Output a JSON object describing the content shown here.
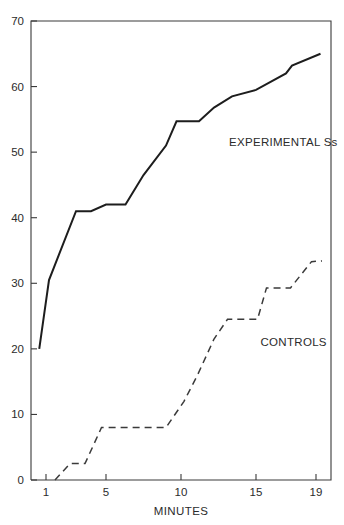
{
  "chart_data": {
    "type": "line",
    "title": "",
    "xlabel": "MINUTES",
    "ylabel": "",
    "xlim": [
      0,
      20
    ],
    "ylim": [
      0,
      70
    ],
    "grid": false,
    "legend_position": "inline-annotation",
    "x_ticks": [
      1,
      5,
      10,
      15,
      19
    ],
    "x_tick_labels": [
      "1",
      "5",
      "10",
      "15",
      "19"
    ],
    "y_ticks": [
      0,
      10,
      20,
      30,
      40,
      50,
      60,
      70
    ],
    "y_tick_labels": [
      "0",
      "10",
      "20",
      "30",
      "40",
      "50",
      "60",
      "70"
    ],
    "series": [
      {
        "name": "EXPERIMENTAL Ss",
        "style": "solid",
        "color": "#1d1d1d",
        "annotation": "EXPERIMENTAL Ss",
        "x": [
          0.55,
          1.2,
          3.0,
          4.0,
          5.0,
          6.3,
          7.5,
          9.0,
          9.7,
          11.2,
          12.2,
          13.4,
          15.0,
          17.0,
          17.4,
          19.3
        ],
        "y": [
          20.0,
          30.5,
          41.0,
          41.0,
          42.0,
          42.0,
          46.5,
          51.0,
          54.7,
          54.7,
          56.8,
          58.5,
          59.5,
          62.0,
          63.2,
          65.0
        ]
      },
      {
        "name": "CONTROLS",
        "style": "dashed",
        "color": "#3a3a3a",
        "annotation": "CONTROLS",
        "x": [
          1.6,
          2.6,
          3.6,
          4.7,
          9.0,
          10.2,
          11.1,
          12.2,
          13.1,
          15.1,
          15.7,
          17.3,
          18.7,
          19.4
        ],
        "y": [
          0.0,
          2.5,
          2.5,
          8.0,
          8.0,
          12.0,
          16.0,
          21.5,
          24.5,
          24.5,
          29.3,
          29.3,
          33.3,
          33.4
        ]
      }
    ],
    "annotations": [
      {
        "text": "EXPERIMENTAL Ss",
        "x": 13.2,
        "y": 51.0
      },
      {
        "text": "CONTROLS",
        "x": 15.3,
        "y": 20.5
      }
    ]
  }
}
